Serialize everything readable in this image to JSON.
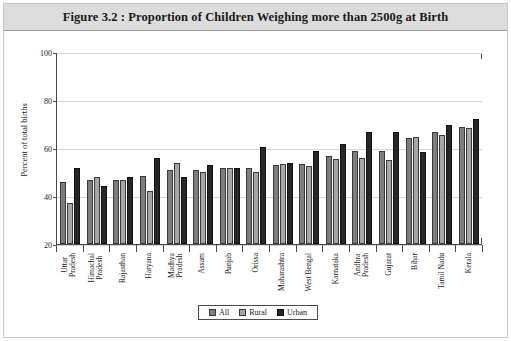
{
  "figure": {
    "title": "Figure 3.2 : Proportion of Children Weighing more than 2500g at Birth"
  },
  "legend": {
    "items": [
      {
        "label": "All",
        "color": "#7d7d7d",
        "key": "all"
      },
      {
        "label": "Rural",
        "color": "#a6a6a6",
        "key": "rural"
      },
      {
        "label": "Urban",
        "color": "#272727",
        "key": "urban"
      }
    ]
  },
  "axes": {
    "y_title": "Percent of total births",
    "y_ticks": [
      20,
      40,
      60,
      80,
      100
    ]
  },
  "chart_data": {
    "type": "bar",
    "title": "Figure 3.2 : Proportion of Children Weighing more than 2500g at Birth",
    "xlabel": "",
    "ylabel": "Percent of total births",
    "ylim": [
      20,
      100
    ],
    "yticks": [
      20,
      40,
      60,
      80,
      100
    ],
    "grid": true,
    "legend_position": "bottom-center",
    "categories": [
      "Uttar Pradesh",
      "Himachal Pradesh",
      "Rajasthan",
      "Haryana",
      "Madhya Pradesh",
      "Assam",
      "Punjab",
      "Orissa",
      "Maharashtra",
      "West Bengal",
      "Karnataka",
      "Andhra Pradesh",
      "Gujarat",
      "Bihar",
      "Tamil Nadu",
      "Kerala"
    ],
    "category_lines": [
      [
        "Uttar",
        "Pradesh"
      ],
      [
        "Himachal",
        "Pradesh"
      ],
      [
        "Rajasthan"
      ],
      [
        "Haryana"
      ],
      [
        "Madhya",
        "Pradesh"
      ],
      [
        "Assam"
      ],
      [
        "Punjab"
      ],
      [
        "Orissa"
      ],
      [
        "Maharashtra"
      ],
      [
        "West Bengal"
      ],
      [
        "Karnataka"
      ],
      [
        "Andhra",
        "Pradesh"
      ],
      [
        "Gujarat"
      ],
      [
        "Bihar"
      ],
      [
        "Tamil Nadu"
      ],
      [
        "Kerala"
      ]
    ],
    "series": [
      {
        "name": "All",
        "color": "#7d7d7d",
        "values": [
          46,
          47,
          47,
          48.5,
          51,
          51,
          52,
          52,
          53,
          53.5,
          57,
          59,
          59,
          64.5,
          67,
          69
        ]
      },
      {
        "name": "Rural",
        "color": "#a6a6a6",
        "values": [
          37,
          48,
          47,
          42,
          54,
          50,
          52,
          50,
          53.5,
          52.5,
          55.5,
          56,
          55,
          65,
          65.5,
          68.5
        ]
      },
      {
        "name": "Urban",
        "color": "#272727",
        "values": [
          52,
          44.5,
          48,
          56,
          48,
          53,
          52,
          60.5,
          54,
          59,
          62,
          67,
          67,
          58.5,
          70,
          72.5
        ]
      }
    ]
  }
}
